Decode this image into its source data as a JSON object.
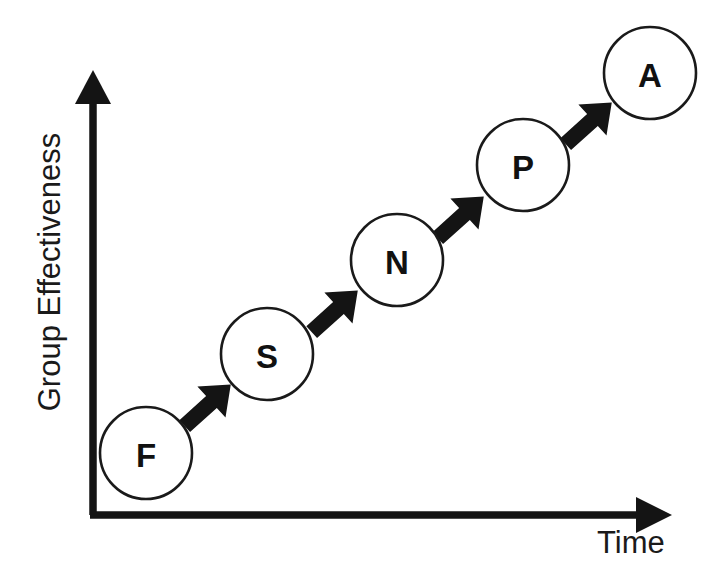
{
  "chart_data": {
    "type": "scatter",
    "title": "",
    "subtitle": "",
    "xlabel": "Time",
    "ylabel": "Group Effectiveness",
    "grid": false,
    "legend": null,
    "axis_style": "arrow",
    "xlim": [
      0,
      100
    ],
    "ylim": [
      0,
      100
    ],
    "x_ticks": [],
    "y_ticks": [],
    "note": "Ascending sequence of five labelled stage circles connected by block arrows; effectiveness rises over time.",
    "categories": [
      "F",
      "S",
      "N",
      "P",
      "A"
    ],
    "points": [
      {
        "label": "F",
        "x": 9,
        "y": 12
      },
      {
        "label": "S",
        "x": 30,
        "y": 31
      },
      {
        "label": "N",
        "x": 49,
        "y": 51
      },
      {
        "label": "P",
        "x": 69,
        "y": 70
      },
      {
        "label": "A",
        "x": 89,
        "y": 88
      }
    ],
    "connectors": [
      {
        "from": "F",
        "to": "S",
        "style": "block-arrow"
      },
      {
        "from": "S",
        "to": "N",
        "style": "block-arrow"
      },
      {
        "from": "N",
        "to": "P",
        "style": "block-arrow"
      },
      {
        "from": "P",
        "to": "A",
        "style": "block-arrow"
      }
    ],
    "colors": {
      "ink": "#141414",
      "circle_stroke": "#1a1a1a",
      "circle_fill": "#ffffff",
      "background": "#ffffff"
    }
  },
  "diagram": {
    "axes": {
      "y_label": "Group Effectiveness",
      "x_label": "Time"
    },
    "nodes": [
      {
        "id": "node-f",
        "letter": "F",
        "cx": 146,
        "cy": 453,
        "r": 46
      },
      {
        "id": "node-s",
        "letter": "S",
        "cx": 267,
        "cy": 354,
        "r": 46
      },
      {
        "id": "node-n",
        "letter": "N",
        "cx": 397,
        "cy": 260,
        "r": 46
      },
      {
        "id": "node-p",
        "letter": "P",
        "cx": 523,
        "cy": 165,
        "r": 46
      },
      {
        "id": "node-a",
        "letter": "A",
        "cx": 650,
        "cy": 73,
        "r": 46
      }
    ],
    "arrows": [
      {
        "id": "arrow-f-s",
        "cx": 207,
        "cy": 406,
        "angle": -42
      },
      {
        "id": "arrow-s-n",
        "cx": 334,
        "cy": 312,
        "angle": -42
      },
      {
        "id": "arrow-n-p",
        "cx": 460,
        "cy": 218,
        "angle": -42
      },
      {
        "id": "arrow-p-a",
        "cx": 588,
        "cy": 124,
        "angle": -42
      }
    ]
  }
}
